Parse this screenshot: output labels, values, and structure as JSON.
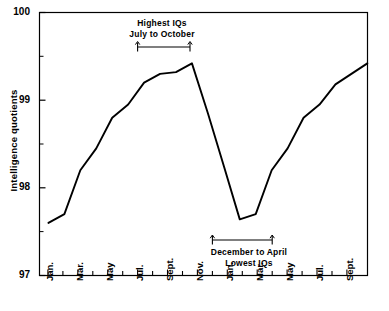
{
  "chart_data": {
    "type": "line",
    "title": "",
    "xlabel": "",
    "ylabel": "Intelligence quotients",
    "ylim": [
      97,
      100
    ],
    "ytick_labels": [
      "100",
      "99",
      "98",
      "97"
    ],
    "ytick_values": [
      100,
      99,
      98,
      97
    ],
    "yminor_values": [
      99.5,
      98.5,
      97.5
    ],
    "grid": false,
    "legend": null,
    "x": [
      "Jan.",
      "Feb.",
      "Mar.",
      "Apr.",
      "May",
      "Jun.",
      "Jul.",
      "Aug.",
      "Sept.",
      "Oct.",
      "Nov.",
      "Dec.",
      "Jan.",
      "Feb.",
      "Mar.",
      "Apr.",
      "May",
      "Jun.",
      "Jul.",
      "Aug.",
      "Sept."
    ],
    "xtick_labels": [
      "Jan.",
      "Mar.",
      "May",
      "Jul.",
      "Sept.",
      "Nov.",
      "Jan.",
      "Mar.",
      "May",
      "Jul.",
      "Sept."
    ],
    "values": [
      97.6,
      97.7,
      98.2,
      98.45,
      98.8,
      98.95,
      99.2,
      99.3,
      99.32,
      99.42,
      98.85,
      98.25,
      97.64,
      97.7,
      98.2,
      98.45,
      98.8,
      98.95,
      99.18,
      99.3,
      99.42
    ],
    "series": [
      {
        "name": "Intelligence quotients",
        "values": [
          97.6,
          97.7,
          98.2,
          98.45,
          98.8,
          98.95,
          99.2,
          99.3,
          99.32,
          99.42,
          98.85,
          98.25,
          97.64,
          97.7,
          98.2,
          98.45,
          98.8,
          98.95,
          99.18,
          99.3,
          99.42
        ]
      }
    ],
    "annotations": [
      {
        "id": "highest",
        "line1": "Highest IQs",
        "line2": "July to October",
        "range_start": "Jul.",
        "range_end": "Oct.",
        "position": "above"
      },
      {
        "id": "lowest",
        "line1": "December to April",
        "line2": "Lowest IQs",
        "range_start": "Dec.",
        "range_end": "Apr.",
        "position": "below"
      }
    ],
    "line_color": "#000000",
    "axis_color": "#000000"
  }
}
